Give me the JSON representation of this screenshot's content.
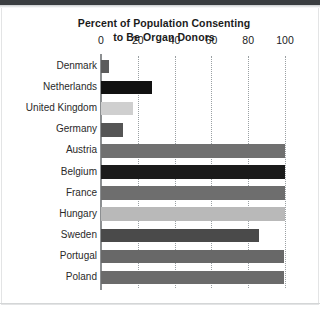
{
  "figure": {
    "title_line1": "Percent of Population Consenting",
    "title_line2": "to Be Organ Donors"
  },
  "chart_data": {
    "type": "bar",
    "orientation": "horizontal",
    "title": "Percent of Population Consenting to Be Organ Donors",
    "xlabel": "",
    "ylabel": "",
    "xlim": [
      0,
      100
    ],
    "xticks": [
      "0",
      "20",
      "40",
      "60",
      "80",
      "100"
    ],
    "xtick_values": [
      0,
      20,
      40,
      60,
      80,
      100
    ],
    "grid": "vertical dotted gridlines at each tick",
    "legend": "none",
    "categories": [
      "Denmark",
      "Netherlands",
      "United Kingdom",
      "Germany",
      "Austria",
      "Belgium",
      "France",
      "Hungary",
      "Sweden",
      "Portugal",
      "Poland"
    ],
    "values": [
      4.25,
      27.5,
      17.17,
      12,
      99.98,
      99.91,
      99.97,
      99.97,
      85.9,
      99.64,
      99.5
    ],
    "bar_colors": [
      "#5c5c5c",
      "#111111",
      "#cfcfcf",
      "#555555",
      "#707070",
      "#1b1b1b",
      "#6e6e6e",
      "#b9b9b9",
      "#4a4a4a",
      "#686868",
      "#6b6b6b"
    ]
  }
}
